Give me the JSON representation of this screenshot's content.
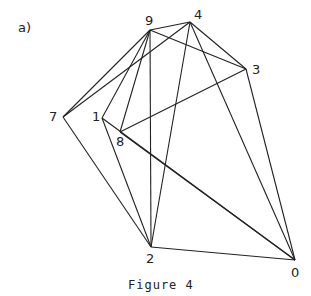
{
  "panel_label": "a)",
  "caption": "Figure 4",
  "nodes": [
    {
      "id": "0",
      "x": 295,
      "y": 260
    },
    {
      "id": "1",
      "x": 102,
      "y": 118
    },
    {
      "id": "2",
      "x": 151,
      "y": 247
    },
    {
      "id": "3",
      "x": 246,
      "y": 69
    },
    {
      "id": "4",
      "x": 190,
      "y": 22
    },
    {
      "id": "7",
      "x": 63,
      "y": 117
    },
    {
      "id": "8",
      "x": 120,
      "y": 132
    },
    {
      "id": "9",
      "x": 150,
      "y": 30
    }
  ],
  "edges": [
    [
      "9",
      "4"
    ],
    [
      "9",
      "3"
    ],
    [
      "9",
      "7"
    ],
    [
      "9",
      "1"
    ],
    [
      "9",
      "8"
    ],
    [
      "9",
      "2"
    ],
    [
      "4",
      "3"
    ],
    [
      "4",
      "7"
    ],
    [
      "4",
      "2"
    ],
    [
      "4",
      "0"
    ],
    [
      "3",
      "8"
    ],
    [
      "3",
      "0"
    ],
    [
      "7",
      "2"
    ],
    [
      "1",
      "2"
    ],
    [
      "1",
      "0"
    ],
    [
      "8",
      "0"
    ],
    [
      "2",
      "0"
    ]
  ],
  "line_color": "#222222"
}
